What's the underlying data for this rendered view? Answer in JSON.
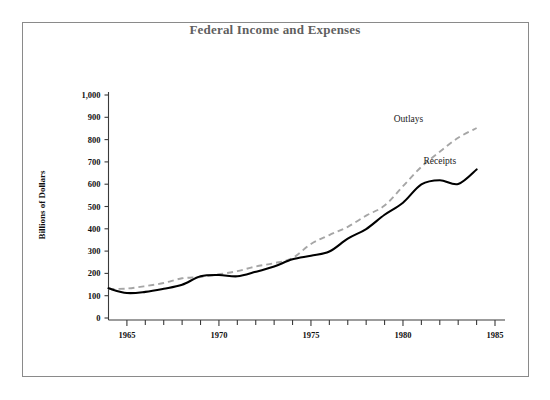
{
  "figure": {
    "title": "Federal Income and Expenses",
    "background_color": "#ffffff",
    "frame_color": "#8a8a8a",
    "title_color": "#5f5f5f"
  },
  "axes": {
    "y_axis_title": "Billions of Dollars",
    "y_tick_labels": [
      "1,000",
      "900",
      "800",
      "700",
      "600",
      "500",
      "400",
      "300",
      "200",
      "100",
      "0"
    ],
    "x_tick_labels": [
      "1965",
      "1970",
      "1975",
      "1980",
      "1985"
    ]
  },
  "series_labels": {
    "outlays": "Outlays",
    "receipts": "Receipts"
  },
  "chart_data": {
    "type": "line",
    "title": "Federal Income and Expenses",
    "xlabel": "",
    "ylabel": "Billions of Dollars",
    "xlim": [
      1964,
      1985
    ],
    "ylim": [
      0,
      1000
    ],
    "grid": false,
    "legend_position": "inline-annotations",
    "x_ticks_major": [
      1965,
      1970,
      1975,
      1980,
      1985
    ],
    "x_ticks_minor_step": 1,
    "y_ticks": [
      0,
      100,
      200,
      300,
      400,
      500,
      600,
      700,
      800,
      900,
      1000
    ],
    "x": [
      1964,
      1965,
      1966,
      1967,
      1968,
      1969,
      1970,
      1971,
      1972,
      1973,
      1974,
      1975,
      1976,
      1977,
      1978,
      1979,
      1980,
      1981,
      1982,
      1983,
      1984
    ],
    "series": [
      {
        "name": "Outlays",
        "style": "dashed",
        "color": "#a6a6a6",
        "values": [
          130,
          132,
          143,
          157,
          178,
          184,
          196,
          210,
          231,
          246,
          269,
          332,
          372,
          409,
          459,
          504,
          591,
          678,
          746,
          808,
          852
        ]
      },
      {
        "name": "Receipts",
        "style": "solid",
        "color": "#000000",
        "values": [
          133,
          112,
          117,
          131,
          149,
          187,
          193,
          187,
          207,
          231,
          263,
          279,
          298,
          356,
          399,
          463,
          517,
          599,
          618,
          601,
          666
        ]
      }
    ],
    "annotations": [
      {
        "text": "Outlays",
        "x": 1980.3,
        "y": 880
      },
      {
        "text": "Receipts",
        "x": 1982.0,
        "y": 690
      }
    ]
  }
}
